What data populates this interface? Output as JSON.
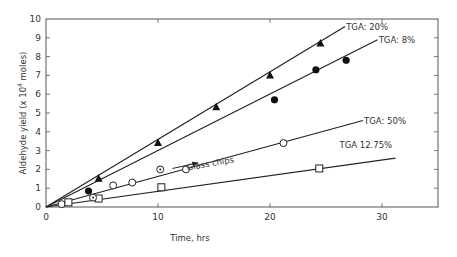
{
  "chart_data": {
    "type": "scatter",
    "title": "",
    "xlabel": "Time, hrs",
    "ylabel": "Aldehyde yield (x 10^4 moles)",
    "ylabel_parts": {
      "main": "Aldehyde yield (x 10",
      "sup": "4",
      "end": " moles)"
    },
    "xlim": [
      0,
      35
    ],
    "ylim": [
      0,
      10
    ],
    "x_ticks": [
      0,
      10,
      20,
      30
    ],
    "y_ticks": [
      0,
      1,
      2,
      3,
      4,
      5,
      6,
      7,
      8,
      9,
      10
    ],
    "grid": false,
    "legend": "inline annotations",
    "series": [
      {
        "name": "TGA: 20%",
        "marker": "filled-triangle",
        "points": [
          [
            4.7,
            1.5
          ],
          [
            10.0,
            3.4
          ],
          [
            15.2,
            5.3
          ],
          [
            20.0,
            7.0
          ],
          [
            24.5,
            8.7
          ]
        ],
        "fit_line": [
          [
            0,
            0
          ],
          [
            26.7,
            9.6
          ]
        ],
        "label": {
          "text": "TGA: 20%",
          "x": 26.8,
          "y": 9.6
        }
      },
      {
        "name": "TGA: 8%",
        "marker": "filled-circle",
        "points": [
          [
            3.8,
            0.85
          ],
          [
            20.4,
            5.7
          ],
          [
            24.1,
            7.3
          ],
          [
            26.8,
            7.8
          ]
        ],
        "fit_line": [
          [
            0,
            0
          ],
          [
            29.6,
            8.9
          ]
        ],
        "label": {
          "text": "TGA: 8%",
          "x": 29.7,
          "y": 8.9
        }
      },
      {
        "name": "TGA: 50%",
        "marker": "open-circle",
        "points": [
          [
            1.4,
            0.15
          ],
          [
            6.0,
            1.15
          ],
          [
            7.7,
            1.3
          ],
          [
            12.5,
            2.0
          ],
          [
            21.2,
            3.4
          ]
        ],
        "fit_line": [
          [
            0,
            0
          ],
          [
            28.3,
            4.6
          ]
        ],
        "label": {
          "text": "TGA: 50%",
          "x": 28.4,
          "y": 4.6
        }
      },
      {
        "name": "TGA 12.75%",
        "marker": "open-square",
        "points": [
          [
            2.0,
            0.25
          ],
          [
            4.7,
            0.45
          ],
          [
            10.3,
            1.05
          ],
          [
            24.4,
            2.05
          ]
        ],
        "fit_line": [
          [
            0,
            0
          ],
          [
            31.2,
            2.6
          ]
        ],
        "label": {
          "text": "TGA 12.75%",
          "x": 26.2,
          "y": 3.3
        }
      },
      {
        "name": "Glass chips",
        "marker": "dotted-circle",
        "points": [
          [
            4.2,
            0.5
          ],
          [
            10.2,
            2.0
          ]
        ],
        "label": {
          "text": "Glass chips",
          "x": 12.6,
          "y": 2.1
        }
      }
    ],
    "annotations": [
      {
        "text": "Glass chips",
        "arrow_from": [
          11.3,
          2.05
        ],
        "arrow_to": [
          13.6,
          2.35
        ]
      }
    ]
  },
  "axes": {
    "x_tick_labels": [
      "0",
      "10",
      "20",
      "30"
    ],
    "y_tick_labels": [
      "0",
      "1",
      "2",
      "3",
      "4",
      "5",
      "6",
      "7",
      "8",
      "9",
      "10"
    ]
  }
}
